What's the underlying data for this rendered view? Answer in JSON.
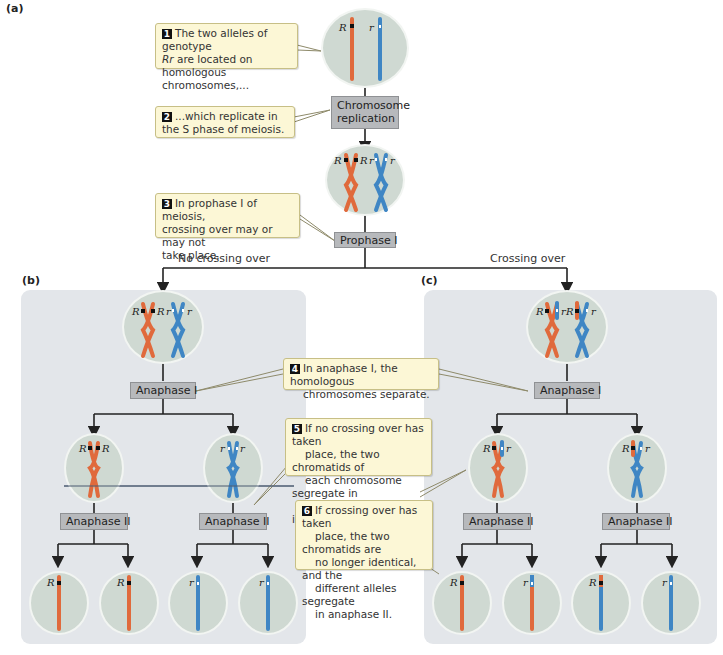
{
  "panels": {
    "a": {
      "label": "(a)"
    },
    "b": {
      "label": "(b)"
    },
    "c": {
      "label": "(c)"
    }
  },
  "stages": {
    "chromosome_replication": "Chromosome replication",
    "chromosome_replication_line1": "Chromosome",
    "chromosome_replication_line2": "replication",
    "prophase1": "Prophase I",
    "anaphase1_left": "Anaphase I",
    "anaphase1_right": "Anaphase I",
    "anaphase2_b_left": "Anaphase II",
    "anaphase2_b_right": "Anaphase II",
    "anaphase2_c_left": "Anaphase II",
    "anaphase2_c_right": "Anaphase II"
  },
  "branches": {
    "left": "No crossing over",
    "right": "Crossing over"
  },
  "callouts": [
    {
      "num": "1",
      "lines": [
        "The two alleles of genotype",
        "Rr are located on",
        "homologous chromosomes,..."
      ]
    },
    {
      "num": "2",
      "lines": [
        "...which replicate in",
        "the S phase of meiosis."
      ]
    },
    {
      "num": "3",
      "lines": [
        "In prophase I of meiosis,",
        "crossing over may or may not",
        "take place."
      ]
    },
    {
      "num": "4",
      "lines": [
        "In anaphase I, the homologous",
        "chromosomes separate."
      ]
    },
    {
      "num": "5",
      "lines": [
        "If no crossing over has taken",
        "place, the two chromatids of",
        "each chromosome segregate in",
        "anaphase II and are identical."
      ]
    },
    {
      "num": "6",
      "lines": [
        "If crossing over has taken",
        "place, the two chromatids are",
        "no longer identical, and the",
        "different alleles segregate",
        "in anaphase II."
      ]
    }
  ],
  "alleles": {
    "dominant": "R",
    "recessive": "r",
    "genotype": "Rr"
  },
  "colors": {
    "maternal_chromosome": "#e06a3c",
    "paternal_chromosome": "#3f86c4",
    "cell_fill": "#cfd9d2",
    "panel_bg": "#e3e6ea",
    "callout_bg": "#fcf7d6",
    "stage_box": "#b7b9bc"
  }
}
